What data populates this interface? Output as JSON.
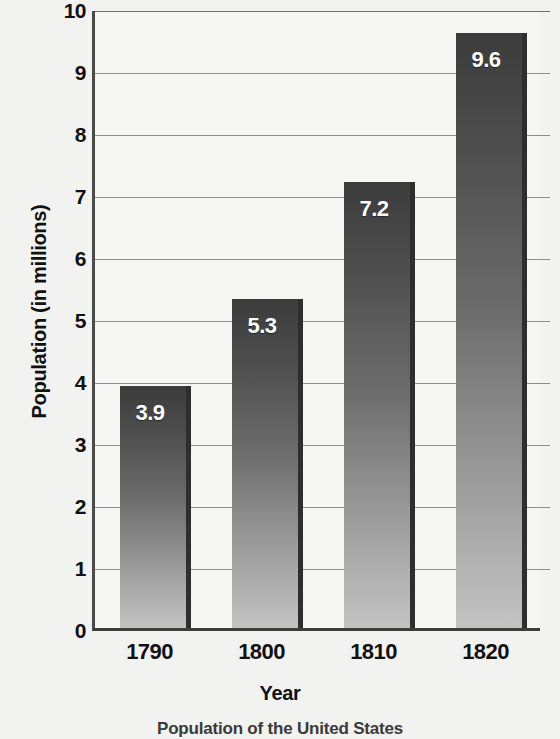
{
  "chart_data": {
    "type": "bar",
    "title": "",
    "categories": [
      "1790",
      "1800",
      "1810",
      "1820"
    ],
    "values": [
      3.9,
      5.3,
      7.2,
      9.6
    ],
    "value_labels": [
      "3.9",
      "5.3",
      "7.2",
      "9.6"
    ],
    "xlabel": "Year",
    "ylabel": "Population (in millions)",
    "ylim": [
      0,
      10
    ],
    "ytick_labels": [
      "10",
      "9",
      "8",
      "7",
      "6",
      "5",
      "4",
      "3",
      "2",
      "1",
      "0"
    ],
    "ytick_values": [
      10,
      9,
      8,
      7,
      6,
      5,
      4,
      3,
      2,
      1,
      0
    ],
    "grid": "horizontal",
    "legend": "none",
    "bar_color_top": "#3c3c3c",
    "bar_color_bottom": "#c3c3c3",
    "value_label_color": "#ffffff",
    "axis_color": "#3d3d3d",
    "gridline_color": "#8e8e8e",
    "background_color": "#f2f2f0"
  },
  "caption": "Population of the United States"
}
